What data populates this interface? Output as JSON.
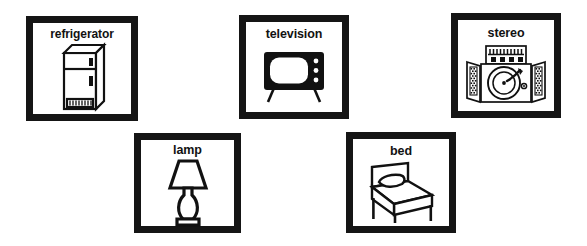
{
  "sheet": {
    "background_color": "#ffffff",
    "ink_color": "#151515",
    "description": "Picture vocabulary flashcard sheet of five household objects",
    "layout": "two rows: three cards on top, two staggered cards below"
  },
  "cards": [
    {
      "id": "refrigerator",
      "label": "refrigerator",
      "icon_name": "refrigerator-icon",
      "row": 1,
      "column": 1
    },
    {
      "id": "television",
      "label": "television",
      "icon_name": "television-icon",
      "row": 1,
      "column": 2
    },
    {
      "id": "stereo",
      "label": "stereo",
      "icon_name": "stereo-icon",
      "row": 1,
      "column": 3
    },
    {
      "id": "lamp",
      "label": "lamp",
      "icon_name": "lamp-icon",
      "row": 2,
      "column": 1
    },
    {
      "id": "bed",
      "label": "bed",
      "icon_name": "bed-icon",
      "row": 2,
      "column": 2
    }
  ]
}
